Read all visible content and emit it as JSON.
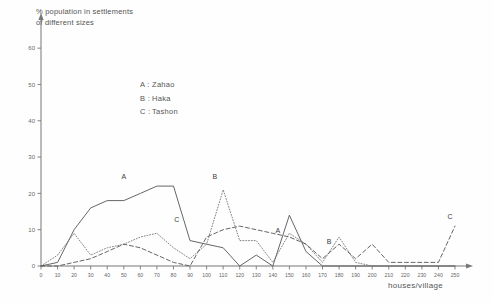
{
  "title": {
    "line1": "% population in settlements",
    "line2": "of different  sizes"
  },
  "legend": {
    "items": [
      {
        "key": "A :",
        "label": "Zahao"
      },
      {
        "key": "B :",
        "label": "Haka"
      },
      {
        "key": "C :",
        "label": "Tashon"
      }
    ]
  },
  "axes": {
    "xlabel": "houses/village",
    "ylabel": "",
    "yticks": [
      0,
      10,
      20,
      30,
      40,
      50,
      60
    ],
    "xticks": [
      0,
      10,
      20,
      30,
      40,
      50,
      60,
      70,
      80,
      90,
      100,
      110,
      120,
      130,
      140,
      150,
      160,
      170,
      180,
      190,
      200,
      210,
      220,
      230,
      240,
      250
    ]
  },
  "chart_data": {
    "type": "line",
    "title": "% population in settlements of different sizes",
    "xlabel": "houses/village",
    "ylabel": "% population in settlements of different sizes",
    "xlim": [
      0,
      250
    ],
    "ylim": [
      0,
      65
    ],
    "grid": false,
    "legend_position": "upper-center",
    "x": [
      0,
      10,
      20,
      30,
      40,
      50,
      60,
      70,
      80,
      90,
      100,
      110,
      120,
      130,
      140,
      150,
      160,
      170,
      180,
      190,
      200,
      210,
      220,
      230,
      240,
      250
    ],
    "series": [
      {
        "name": "Zahao",
        "key": "A",
        "style": "solid",
        "color": "#555555",
        "label_x": 50,
        "label_y": 24,
        "values": [
          0,
          1,
          10,
          16,
          18,
          18,
          20,
          22,
          22,
          7,
          6,
          5,
          0,
          3,
          0,
          14,
          4,
          0,
          0,
          0,
          0,
          0,
          0,
          0,
          0,
          0
        ]
      },
      {
        "name": "Haka",
        "key": "B",
        "style": "dotted",
        "color": "#777777",
        "label_x": 105,
        "label_y": 24,
        "values": [
          0,
          3,
          9,
          3,
          5,
          6,
          8,
          9,
          5,
          2,
          6,
          21,
          7,
          7,
          1,
          9,
          6,
          1,
          8,
          1,
          0,
          0,
          0,
          0,
          0,
          0
        ]
      },
      {
        "name": "Tashon",
        "key": "C",
        "style": "dashed",
        "color": "#555555",
        "label_x": 82,
        "label_y": 12,
        "values": [
          0,
          0,
          1,
          2,
          4,
          6,
          5,
          3,
          1,
          0,
          8,
          10,
          11,
          10,
          9,
          8,
          6,
          2,
          6,
          2,
          6,
          1,
          1,
          1,
          1,
          11
        ]
      }
    ],
    "series_annotations": [
      {
        "key": "A",
        "x": 50,
        "y": 24
      },
      {
        "key": "B",
        "x": 105,
        "y": 24
      },
      {
        "key": "C",
        "x": 82,
        "y": 12
      },
      {
        "key": "A",
        "x": 143,
        "y": 9
      },
      {
        "key": "B",
        "x": 174,
        "y": 6
      },
      {
        "key": "C",
        "x": 247,
        "y": 13
      }
    ]
  }
}
